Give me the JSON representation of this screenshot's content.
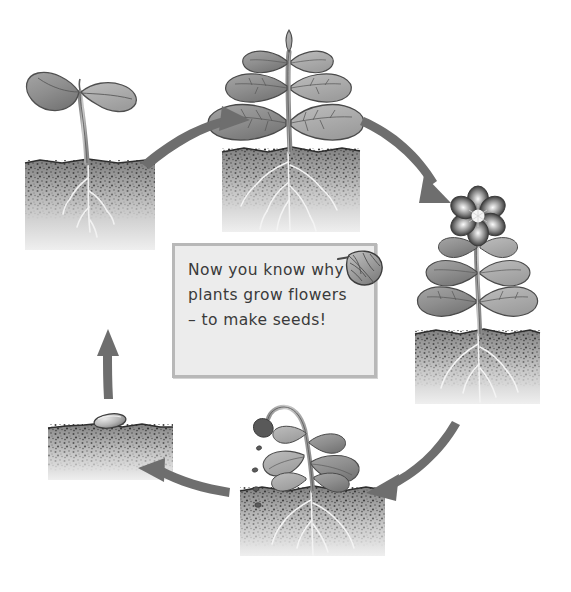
{
  "diagram": {
    "background_color": "#ffffff",
    "ink_color": "#6e6e6e",
    "soil_dark": "#6b6b6b",
    "soil_light": "#d8d8d8"
  },
  "message_box": {
    "name": "info-callout",
    "border_color": "#b8b8b8",
    "fill_color": "#ececec",
    "lines": [
      "Now you know why",
      "plants grow flowers",
      "– to make seeds!"
    ],
    "icon": "leaf-icon"
  },
  "stages": [
    {
      "id": "seedling",
      "label": "Seedling with two cotyledon leaves",
      "position": "left",
      "x": 100,
      "y": 230
    },
    {
      "id": "young-plant",
      "label": "Young leafy plant with roots",
      "position": "top",
      "x": 290,
      "y": 130
    },
    {
      "id": "flowering-plant",
      "label": "Flowering plant with six-petal flower",
      "position": "right",
      "x": 470,
      "y": 300
    },
    {
      "id": "seeding-plant",
      "label": "Plant dropping seeds from drooping seed head",
      "position": "bottom",
      "x": 310,
      "y": 470
    },
    {
      "id": "seed-in-soil",
      "label": "Seed resting on the soil",
      "position": "bottom-left",
      "x": 110,
      "y": 425
    }
  ],
  "arrows": [
    {
      "id": "arrow-seedling-to-young",
      "from": "seedling",
      "to": "young-plant"
    },
    {
      "id": "arrow-young-to-flowering",
      "from": "young-plant",
      "to": "flowering-plant"
    },
    {
      "id": "arrow-flowering-to-seeding",
      "from": "flowering-plant",
      "to": "seeding-plant"
    },
    {
      "id": "arrow-seeding-to-seed",
      "from": "seeding-plant",
      "to": "seed-in-soil"
    },
    {
      "id": "arrow-seed-to-seedling",
      "from": "seed-in-soil",
      "to": "seedling"
    }
  ]
}
